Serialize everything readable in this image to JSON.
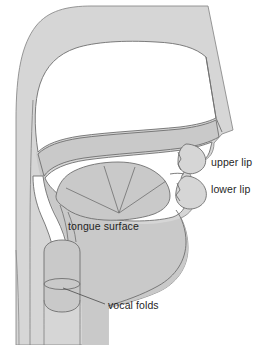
{
  "figure": {
    "type": "anatomical-diagram",
    "background_color": "#ffffff"
  },
  "colors": {
    "tissue_outer": "#d6d6d6",
    "tissue_inner": "#c9c9c9",
    "airway": "#ffffff",
    "stroke": "#6f6f6f",
    "stroke_light": "#8c8c8c",
    "label_text": "#1f1f1f",
    "leader_line": "#4a4a4a"
  },
  "labels": [
    {
      "id": "upper-lip",
      "text": "upper lip",
      "x": 211,
      "y": 157,
      "has_leader": false
    },
    {
      "id": "lower-lip",
      "text": "lower lip",
      "x": 211,
      "y": 184,
      "has_leader": false
    },
    {
      "id": "tongue-surface",
      "text": "tongue surface",
      "x": 68,
      "y": 221,
      "has_leader": true
    },
    {
      "id": "vocal-folds",
      "text": "vocal folds",
      "x": 108,
      "y": 300,
      "has_leader": true
    }
  ],
  "structures": [
    {
      "id": "head-outline",
      "name": "head outline"
    },
    {
      "id": "nasal-cavity",
      "name": "nasal cavity"
    },
    {
      "id": "hard-palate",
      "name": "hard palate"
    },
    {
      "id": "soft-palate",
      "name": "soft palate"
    },
    {
      "id": "oral-cavity",
      "name": "oral cavity"
    },
    {
      "id": "tongue-body",
      "name": "tongue body"
    },
    {
      "id": "tongue-fan-lines",
      "name": "tongue surface radial lines",
      "count": 4
    },
    {
      "id": "upper-lip-shape",
      "name": "upper lip"
    },
    {
      "id": "lower-lip-shape",
      "name": "lower lip"
    },
    {
      "id": "teeth-notch-upper",
      "name": "upper teeth notch"
    },
    {
      "id": "teeth-notch-lower",
      "name": "lower teeth notch"
    },
    {
      "id": "pharynx",
      "name": "pharynx"
    },
    {
      "id": "larynx",
      "name": "larynx"
    },
    {
      "id": "vocal-folds-ellipse",
      "name": "vocal folds"
    },
    {
      "id": "trachea",
      "name": "trachea"
    },
    {
      "id": "spine-line",
      "name": "posterior pharyngeal wall"
    },
    {
      "id": "jaw-chin",
      "name": "jaw and chin"
    }
  ]
}
